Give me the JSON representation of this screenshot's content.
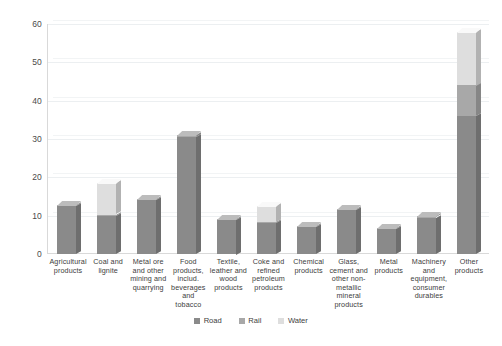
{
  "chart_data": {
    "type": "bar",
    "subtype": "stacked-3d-column",
    "title": "",
    "xlabel": "",
    "ylabel": "",
    "ylim": [
      0,
      60
    ],
    "yticks": [
      0,
      10,
      20,
      30,
      40,
      50,
      60
    ],
    "grid": true,
    "legend_position": "bottom",
    "categories": [
      "Agricultural products",
      "Coal and lignite",
      "Metal ore and other mining and quarrying",
      "Food products, includ. beverages and tobacco",
      "Textile, leather and wood products",
      "Coke and refined petroleum products",
      "Chemical products",
      "Glass, cement and other non-metallic mineral products",
      "Metal products",
      "Machinery and equipment, consumer durables",
      "Other products"
    ],
    "series": [
      {
        "name": "Road",
        "color": "#8a8a8a",
        "values": [
          12.5,
          10.0,
          14.0,
          30.5,
          9.0,
          8.0,
          7.0,
          11.5,
          6.5,
          9.5,
          36.0
        ]
      },
      {
        "name": "Rail",
        "color": "#a8a8a8",
        "values": [
          0.3,
          0.3,
          0.3,
          0.5,
          0.2,
          0.3,
          0.2,
          0.2,
          0.2,
          0.3,
          8.0
        ]
      },
      {
        "name": "Water",
        "color": "#dedede",
        "values": [
          0.0,
          8.2,
          0.0,
          0.0,
          0.0,
          4.2,
          0.0,
          0.0,
          0.0,
          0.0,
          14.0
        ]
      }
    ],
    "totals": [
      12.8,
      18.5,
      14.3,
      31.0,
      9.2,
      12.5,
      7.2,
      11.7,
      6.7,
      9.8,
      58.0
    ]
  },
  "legend": {
    "items": [
      {
        "label": "Road",
        "color": "#8a8a8a"
      },
      {
        "label": "Rail",
        "color": "#a8a8a8"
      },
      {
        "label": "Water",
        "color": "#dedede"
      }
    ]
  },
  "axis": {
    "y_tick_labels": [
      "60",
      "50",
      "40",
      "30",
      "20",
      "10",
      "0"
    ]
  },
  "colors": {
    "road": "#8a8a8a",
    "rail": "#a8a8a8",
    "water": "#dedede",
    "gridline": "#eceff1",
    "axis": "#d9d9d9",
    "text": "#3d3d3d",
    "background": "#ffffff"
  }
}
